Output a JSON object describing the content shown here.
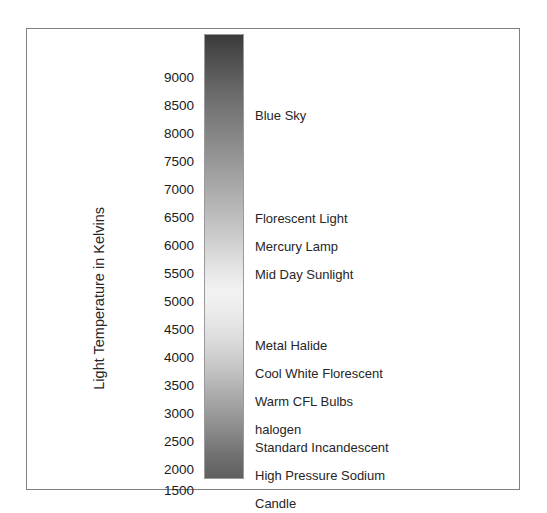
{
  "figure": {
    "axis_title": "Light Temperature in Kelvins",
    "frame_color": "#808080",
    "background": "#ffffff"
  },
  "chart_data": {
    "type": "bar",
    "title": "",
    "subtitle": "",
    "xlabel": "",
    "ylabel": "Light Temperature in Kelvins",
    "ylim": [
      1300,
      9300
    ],
    "grid": false,
    "legend_position": "none",
    "orientation": "vertical",
    "colorbar": {
      "description": "Continuous greyscale gradient representing light color temperature, dark at the high-Kelvin top, brightest near the middle (~4500-5000 K), darkening again toward the low-Kelvin bottom.",
      "top_color": "#3a3a3a",
      "mid_color": "#f2f2f2",
      "bottom_color": "#5f5f5f"
    },
    "tick_values": [
      9000,
      8500,
      8000,
      7500,
      7000,
      6500,
      6000,
      5500,
      5000,
      4500,
      4000,
      3500,
      3000,
      2500,
      2000,
      1500
    ],
    "tick_labels": [
      "9000",
      "8500",
      "8000",
      "7500",
      "7000",
      "6500",
      "6000",
      "5500",
      "5000",
      "4500",
      "4000",
      "3500",
      "3000",
      "2500",
      "2000",
      "1500"
    ],
    "categories": [
      "Blue Sky",
      "Florescent Light",
      "Mercury Lamp",
      "Mid Day  Sunlight",
      "Metal Halide",
      "Cool White Florescent",
      "Warm CFL Bulbs",
      "halogen",
      "Standard Incandescent",
      "High Pressure Sodium",
      "Candle"
    ],
    "values": [
      8000,
      6500,
      6000,
      5700,
      4250,
      3800,
      3350,
      2950,
      2500,
      2050,
      1550
    ],
    "annotations": [
      {
        "label": "Blue Sky",
        "kelvin": 8000
      },
      {
        "label": "Florescent Light",
        "kelvin": 6500
      },
      {
        "label": "Mercury Lamp",
        "kelvin": 6000
      },
      {
        "label": "Mid Day  Sunlight",
        "kelvin": 5700
      },
      {
        "label": "Metal Halide",
        "kelvin": 4250
      },
      {
        "label": "Cool White Florescent",
        "kelvin": 3800
      },
      {
        "label": "Warm CFL Bulbs",
        "kelvin": 3350
      },
      {
        "label": "halogen",
        "kelvin": 2950
      },
      {
        "label": "Standard Incandescent",
        "kelvin": 2500
      },
      {
        "label": "High Pressure Sodium",
        "kelvin": 2050
      },
      {
        "label": "Candle",
        "kelvin": 1550
      }
    ]
  },
  "ticks": [
    {
      "label": "9000",
      "top": 42
    },
    {
      "label": "8500",
      "top": 70
    },
    {
      "label": "8000",
      "top": 98
    },
    {
      "label": "7500",
      "top": 126
    },
    {
      "label": "7000",
      "top": 154
    },
    {
      "label": "6500",
      "top": 182
    },
    {
      "label": "6000",
      "top": 210
    },
    {
      "label": "5500",
      "top": 238
    },
    {
      "label": "5000",
      "top": 266
    },
    {
      "label": "4500",
      "top": 294
    },
    {
      "label": "4000",
      "top": 322
    },
    {
      "label": "3500",
      "top": 350
    },
    {
      "label": "3000",
      "top": 378
    },
    {
      "label": "2500",
      "top": 406
    },
    {
      "label": "2000",
      "top": 434
    },
    {
      "label": "1500",
      "top": 455
    }
  ],
  "sources": [
    {
      "label": "Blue Sky",
      "top": 80
    },
    {
      "label": "Florescent Light",
      "top": 183
    },
    {
      "label": "Mercury Lamp",
      "top": 211
    },
    {
      "label": "Mid Day  Sunlight",
      "top": 239
    },
    {
      "label": "Metal Halide",
      "top": 310
    },
    {
      "label": "Cool White Florescent",
      "top": 338
    },
    {
      "label": "Warm CFL Bulbs",
      "top": 366
    },
    {
      "label": "halogen",
      "top": 394
    },
    {
      "label": "Standard Incandescent",
      "top": 412
    },
    {
      "label": "High Pressure Sodium",
      "top": 440
    },
    {
      "label": "Candle",
      "top": 468
    }
  ]
}
